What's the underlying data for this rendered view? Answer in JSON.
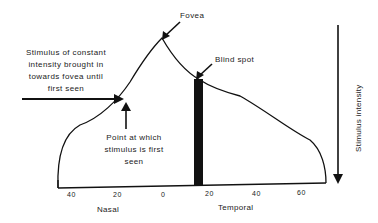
{
  "diagram": {
    "labels": {
      "fovea": "Fovea",
      "blind_spot": "Blind spot",
      "stimulus": [
        "Stimulus of constant",
        "intensity brought in",
        "towards fovea until",
        "first seen"
      ],
      "point": [
        "Point at which",
        "stimulus is first",
        "seen"
      ],
      "y_axis": "Stimulus intensity",
      "x_left": "Nasal",
      "x_right": "Temporal"
    },
    "ticks": [
      "40",
      "20",
      "0",
      "20",
      "40",
      "60"
    ],
    "colors": {
      "line": "#111111",
      "background": "#ffffff"
    }
  }
}
